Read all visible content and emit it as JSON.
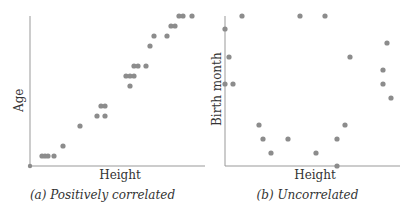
{
  "chart_data": [
    {
      "type": "scatter",
      "title": "",
      "caption": "(a) Positively correlated",
      "xlabel": "Height",
      "ylabel": "Age",
      "grid": false,
      "legend": null,
      "ticks": "none",
      "point_color": "#8c8c8c",
      "axis_color": "#999999",
      "points_px": [
        [
          42,
          156
        ],
        [
          45,
          156
        ],
        [
          48,
          156
        ],
        [
          54,
          156
        ],
        [
          63,
          146
        ],
        [
          80,
          126
        ],
        [
          97,
          116
        ],
        [
          105,
          116
        ],
        [
          101,
          106
        ],
        [
          105,
          106
        ],
        [
          130,
          86
        ],
        [
          126,
          76
        ],
        [
          130,
          76
        ],
        [
          134,
          76
        ],
        [
          134,
          66
        ],
        [
          138,
          66
        ],
        [
          146,
          66
        ],
        [
          150,
          46
        ],
        [
          154,
          36
        ],
        [
          167,
          36
        ],
        [
          171,
          26
        ],
        [
          175,
          26
        ],
        [
          179,
          16
        ],
        [
          183,
          16
        ],
        [
          192,
          16
        ]
      ],
      "origin_point_px": [
        30,
        166
      ],
      "axes_px": {
        "x0": 30,
        "y_bottom": 166,
        "y_top": 16,
        "x_right": 205
      }
    },
    {
      "type": "scatter",
      "title": "",
      "caption": "(b) Uncorrelated",
      "xlabel": "Height",
      "ylabel": "Birth month",
      "grid": false,
      "legend": null,
      "ticks": "none",
      "point_color": "#8c8c8c",
      "axis_color": "#999999",
      "points_px": [
        [
          242,
          16
        ],
        [
          300,
          16
        ],
        [
          325,
          16
        ],
        [
          225,
          29
        ],
        [
          387,
          43
        ],
        [
          229,
          57
        ],
        [
          350,
          57
        ],
        [
          383,
          70
        ],
        [
          225,
          84
        ],
        [
          233,
          84
        ],
        [
          383,
          84
        ],
        [
          391,
          98
        ],
        [
          259,
          125
        ],
        [
          345,
          125
        ],
        [
          263,
          139
        ],
        [
          288,
          139
        ],
        [
          337,
          139
        ],
        [
          271,
          153
        ],
        [
          316,
          153
        ],
        [
          337,
          166
        ]
      ],
      "axes_px": {
        "x0": 225,
        "y_bottom": 166,
        "y_top": 16,
        "x_right": 400
      }
    }
  ],
  "panels": {
    "a": {
      "xlabel": "Height",
      "ylabel": "Age",
      "caption": "(a) Positively correlated"
    },
    "b": {
      "xlabel": "Height",
      "ylabel": "Birth month",
      "caption": "(b) Uncorrelated"
    }
  }
}
